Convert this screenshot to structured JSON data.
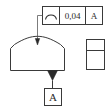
{
  "drawing": {
    "title": "Profile of a surface GD&T callout",
    "background_color": "#ffffff",
    "line_color": "#3a3a3a",
    "text_color": "#2b2b2b",
    "feature_control_frame": {
      "symbol_name": "profile-of-a-surface-symbol",
      "symbol_description": "arc",
      "tolerance_value": "0,04",
      "datum_reference": "A"
    },
    "datum_feature_symbol": {
      "letter": "A"
    },
    "views": {
      "front_view_name": "front-view-domed-part",
      "side_view_name": "side-view-rectangle"
    }
  }
}
